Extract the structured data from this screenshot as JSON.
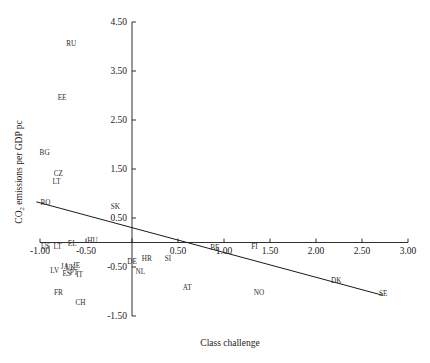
{
  "chart_data": {
    "type": "scatter",
    "title": "",
    "xlabel": "Class challenge",
    "ylabel": "CO2 emissions per GDP pc",
    "ylabel_main": "CO",
    "ylabel_sub": "2",
    "ylabel_rest": " emissions per GDP pc",
    "xlim": [
      -1.0,
      3.0
    ],
    "ylim": [
      -1.5,
      4.5
    ],
    "xticks": [
      -1.0,
      -0.5,
      0.0,
      0.5,
      1.0,
      1.5,
      2.0,
      2.5,
      3.0
    ],
    "xticklabels": [
      "-1.00",
      "-0.50",
      "",
      "0.50",
      "1.00",
      "1.50",
      "2.00",
      "2.50",
      "3.00"
    ],
    "yticks": [
      -1.5,
      -0.5,
      0.5,
      1.5,
      2.5,
      3.5,
      4.5
    ],
    "yticklabels": [
      "-1.50",
      "-0.50",
      "0.50",
      "1.50",
      "2.50",
      "3.50",
      "4.50"
    ],
    "grid": false,
    "legend": false,
    "axes_style": "crossing-at-origin",
    "trendline": {
      "label": "linear fit",
      "x_start": -1.04,
      "y_start": 0.83,
      "x_end": 2.73,
      "y_end": -1.08
    },
    "points": [
      {
        "label": "RU",
        "x": -0.66,
        "y": 4.02
      },
      {
        "label": "EE",
        "x": -0.76,
        "y": 2.9
      },
      {
        "label": "BG",
        "x": -0.95,
        "y": 1.78
      },
      {
        "label": "CZ",
        "x": -0.8,
        "y": 1.36
      },
      {
        "label": "LT",
        "x": -0.82,
        "y": 1.2
      },
      {
        "label": "RO",
        "x": -0.94,
        "y": 0.76
      },
      {
        "label": "SK",
        "x": -0.18,
        "y": 0.68
      },
      {
        "label": "US",
        "x": -0.94,
        "y": -0.14
      },
      {
        "label": "LT",
        "x": -0.81,
        "y": -0.14
      },
      {
        "label": "EL",
        "x": -0.65,
        "y": -0.08
      },
      {
        "label": "HU",
        "x": -0.43,
        "y": -0.02
      },
      {
        "label": "DE",
        "x": 0.0,
        "y": -0.43
      },
      {
        "label": "HR",
        "x": 0.16,
        "y": -0.37
      },
      {
        "label": "SI",
        "x": 0.39,
        "y": -0.37
      },
      {
        "label": "BE",
        "x": 0.9,
        "y": -0.16
      },
      {
        "label": "FI",
        "x": 1.33,
        "y": -0.14
      },
      {
        "label": "LV",
        "x": -0.84,
        "y": -0.62
      },
      {
        "label": "JA",
        "x": -0.73,
        "y": -0.54
      },
      {
        "label": "UK",
        "x": -0.67,
        "y": -0.56
      },
      {
        "label": "IE",
        "x": -0.6,
        "y": -0.52
      },
      {
        "label": "ES",
        "x": -0.71,
        "y": -0.68
      },
      {
        "label": "PT",
        "x": -0.63,
        "y": -0.66
      },
      {
        "label": "IT",
        "x": -0.57,
        "y": -0.7
      },
      {
        "label": "NL",
        "x": 0.09,
        "y": -0.65
      },
      {
        "label": "AT",
        "x": 0.6,
        "y": -0.96
      },
      {
        "label": "NO",
        "x": 1.38,
        "y": -1.08
      },
      {
        "label": "FR",
        "x": -0.8,
        "y": -1.07
      },
      {
        "label": "CH",
        "x": -0.56,
        "y": -1.27
      },
      {
        "label": "DK",
        "x": 2.22,
        "y": -0.83
      },
      {
        "label": "SE",
        "x": 2.73,
        "y": -1.09
      }
    ]
  }
}
